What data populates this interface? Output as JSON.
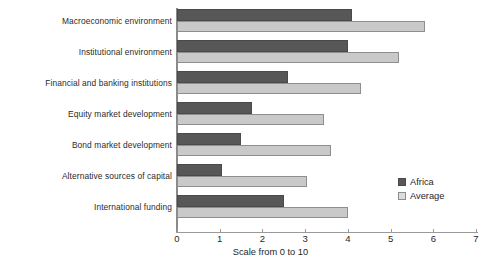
{
  "chart_data": {
    "type": "bar",
    "orientation": "horizontal",
    "title": "",
    "xlabel": "Scale from 0 to 10",
    "ylabel": "",
    "xlim": [
      0,
      7
    ],
    "xticks": [
      0,
      1,
      2,
      3,
      4,
      5,
      6,
      7
    ],
    "grid": false,
    "legend_position": "inside-right",
    "categories": [
      "Macroeconomic environment",
      "Institutional environment",
      "Financial and banking institutions",
      "Equity market development",
      "Bond market development",
      "Alternative sources of capital",
      "International funding"
    ],
    "series": [
      {
        "name": "Africa",
        "color": "#575757",
        "values": [
          4.1,
          4.0,
          2.6,
          1.75,
          1.5,
          1.05,
          2.5
        ]
      },
      {
        "name": "Average",
        "color": "#c9c9c9",
        "values": [
          5.8,
          5.2,
          4.3,
          3.45,
          3.6,
          3.05,
          4.0
        ]
      }
    ]
  },
  "legend": {
    "items": [
      {
        "label": "Africa"
      },
      {
        "label": "Average"
      }
    ]
  }
}
